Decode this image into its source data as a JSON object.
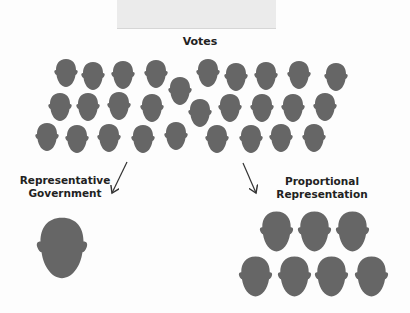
{
  "title": "Votes",
  "labels": {
    "left": [
      "Representative",
      "Government"
    ],
    "right": [
      "Proportional",
      "Representation"
    ]
  },
  "colors": {
    "head": "#666666",
    "background": "#fdfdfd",
    "tape": "#ebebeb",
    "text": "#222222"
  },
  "votes": {
    "count": 28,
    "heads": [
      {
        "x": 66,
        "y": 58
      },
      {
        "x": 93,
        "y": 61
      },
      {
        "x": 123,
        "y": 60
      },
      {
        "x": 156,
        "y": 59
      },
      {
        "x": 180,
        "y": 76
      },
      {
        "x": 208,
        "y": 58
      },
      {
        "x": 236,
        "y": 62
      },
      {
        "x": 266,
        "y": 61
      },
      {
        "x": 299,
        "y": 60
      },
      {
        "x": 336,
        "y": 62
      },
      {
        "x": 60,
        "y": 92
      },
      {
        "x": 88,
        "y": 92
      },
      {
        "x": 119,
        "y": 91
      },
      {
        "x": 152,
        "y": 93
      },
      {
        "x": 200,
        "y": 98
      },
      {
        "x": 230,
        "y": 93
      },
      {
        "x": 262,
        "y": 93
      },
      {
        "x": 293,
        "y": 93
      },
      {
        "x": 325,
        "y": 92
      },
      {
        "x": 47,
        "y": 122
      },
      {
        "x": 77,
        "y": 124
      },
      {
        "x": 109,
        "y": 123
      },
      {
        "x": 143,
        "y": 124
      },
      {
        "x": 176,
        "y": 121
      },
      {
        "x": 217,
        "y": 124
      },
      {
        "x": 251,
        "y": 124
      },
      {
        "x": 281,
        "y": 123
      },
      {
        "x": 314,
        "y": 123
      }
    ]
  },
  "representative": {
    "count": 1,
    "heads": [
      {
        "x": 62,
        "y": 215,
        "w": 56,
        "h": 66
      }
    ]
  },
  "proportional": {
    "count": 7,
    "heads": [
      {
        "x": 276,
        "y": 210
      },
      {
        "x": 314,
        "y": 210
      },
      {
        "x": 352,
        "y": 210
      },
      {
        "x": 255,
        "y": 255
      },
      {
        "x": 294,
        "y": 255
      },
      {
        "x": 331,
        "y": 255
      },
      {
        "x": 371,
        "y": 255
      }
    ]
  },
  "arrows": [
    {
      "name": "arrow-to-representative",
      "x1": 127,
      "y1": 162,
      "x2": 112,
      "y2": 193
    },
    {
      "name": "arrow-to-proportional",
      "x1": 243,
      "y1": 163,
      "x2": 256,
      "y2": 193
    }
  ]
}
